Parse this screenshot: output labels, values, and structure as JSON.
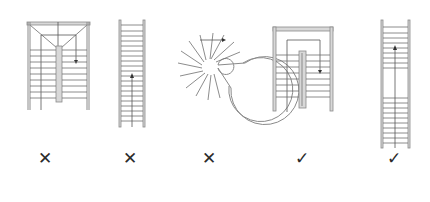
{
  "figure": {
    "items": [
      {
        "id": "stair-1",
        "type": "dog-leg with landing (triangular winder top)",
        "mark": "✕",
        "verdict": "incorrect",
        "center_x": 48
      },
      {
        "id": "stair-2",
        "type": "straight single flight",
        "mark": "✕",
        "verdict": "incorrect",
        "center_x": 130
      },
      {
        "id": "stair-3",
        "type": "spiral",
        "mark": "✕",
        "verdict": "incorrect",
        "center_x": 210
      },
      {
        "id": "stair-4",
        "type": "dog-leg (half-turn) with landing",
        "mark": "✓",
        "verdict": "correct",
        "center_x": 302
      },
      {
        "id": "stair-5",
        "type": "straight double flight with mid landing",
        "mark": "✓",
        "verdict": "correct",
        "center_x": 394
      }
    ],
    "colors": {
      "line": "#8a8a8a",
      "mark": "#2b2b2b",
      "background": "#ffffff"
    }
  }
}
